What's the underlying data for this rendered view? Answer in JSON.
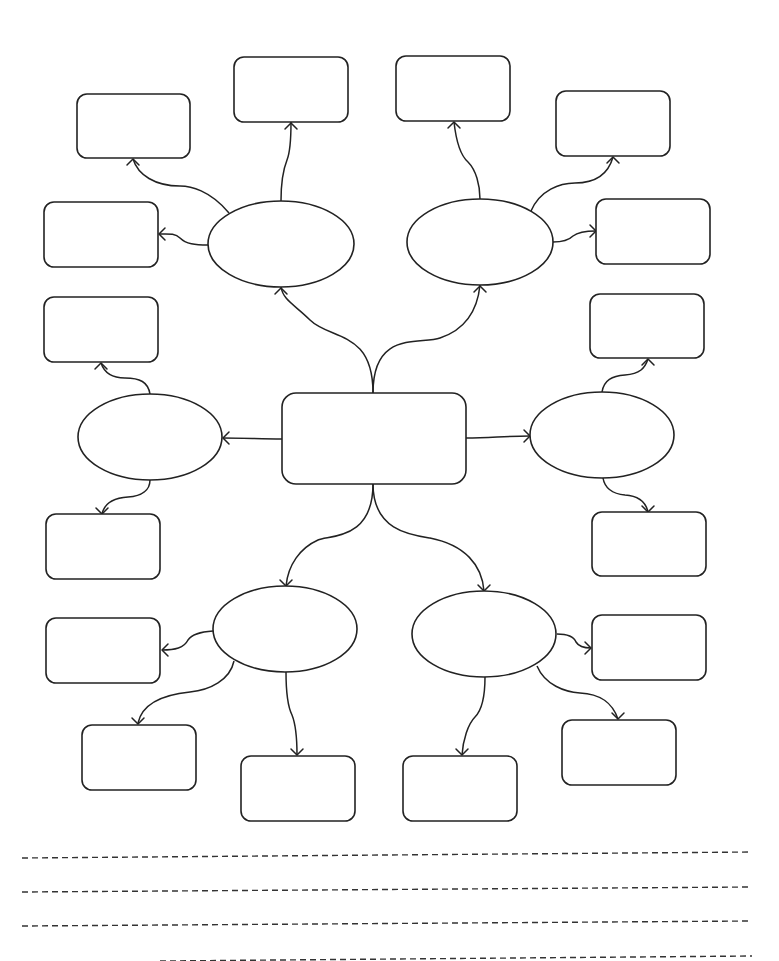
{
  "diagram": {
    "type": "mind-map-worksheet",
    "colors": {
      "stroke": "#222222",
      "background": "#ffffff",
      "lines": "#333333"
    },
    "center": {
      "id": "center",
      "x": 282,
      "y": 393,
      "w": 184,
      "h": 91,
      "rx": 14,
      "label": ""
    },
    "ovals": [
      {
        "id": "oval-top-left",
        "cx": 281,
        "cy": 244,
        "rx": 73,
        "ry": 43,
        "label": ""
      },
      {
        "id": "oval-top-right",
        "cx": 480,
        "cy": 242,
        "rx": 73,
        "ry": 43,
        "label": ""
      },
      {
        "id": "oval-mid-left",
        "cx": 150,
        "cy": 437,
        "rx": 72,
        "ry": 43,
        "label": ""
      },
      {
        "id": "oval-mid-right",
        "cx": 602,
        "cy": 435,
        "rx": 72,
        "ry": 43,
        "label": ""
      },
      {
        "id": "oval-bottom-left",
        "cx": 285,
        "cy": 629,
        "rx": 72,
        "ry": 43,
        "label": ""
      },
      {
        "id": "oval-bottom-right",
        "cx": 484,
        "cy": 634,
        "rx": 72,
        "ry": 43,
        "label": ""
      }
    ],
    "boxes": [
      {
        "id": "box-1",
        "x": 77,
        "y": 94,
        "w": 113,
        "h": 64,
        "label": ""
      },
      {
        "id": "box-2",
        "x": 234,
        "y": 57,
        "w": 114,
        "h": 65,
        "label": ""
      },
      {
        "id": "box-3",
        "x": 44,
        "y": 202,
        "w": 114,
        "h": 65,
        "label": ""
      },
      {
        "id": "box-4",
        "x": 396,
        "y": 56,
        "w": 114,
        "h": 65,
        "label": ""
      },
      {
        "id": "box-5",
        "x": 556,
        "y": 91,
        "w": 114,
        "h": 65,
        "label": ""
      },
      {
        "id": "box-6",
        "x": 596,
        "y": 199,
        "w": 114,
        "h": 65,
        "label": ""
      },
      {
        "id": "box-7",
        "x": 44,
        "y": 297,
        "w": 114,
        "h": 65,
        "label": ""
      },
      {
        "id": "box-8",
        "x": 46,
        "y": 514,
        "w": 114,
        "h": 65,
        "label": ""
      },
      {
        "id": "box-9",
        "x": 590,
        "y": 294,
        "w": 114,
        "h": 64,
        "label": ""
      },
      {
        "id": "box-10",
        "x": 592,
        "y": 512,
        "w": 114,
        "h": 64,
        "label": ""
      },
      {
        "id": "box-11",
        "x": 46,
        "y": 618,
        "w": 114,
        "h": 65,
        "label": ""
      },
      {
        "id": "box-12",
        "x": 82,
        "y": 725,
        "w": 114,
        "h": 65,
        "label": ""
      },
      {
        "id": "box-13",
        "x": 241,
        "y": 756,
        "w": 114,
        "h": 65,
        "label": ""
      },
      {
        "id": "box-14",
        "x": 592,
        "y": 615,
        "w": 114,
        "h": 65,
        "label": ""
      },
      {
        "id": "box-15",
        "x": 562,
        "y": 720,
        "w": 114,
        "h": 65,
        "label": ""
      },
      {
        "id": "box-16",
        "x": 403,
        "y": 756,
        "w": 114,
        "h": 65,
        "label": ""
      }
    ],
    "connectors": [
      {
        "id": "c-center-ovtl",
        "d": "M373,393 C373,330 330,340 310,320 C295,305 283,300 281,287",
        "tip": [
          281,
          288
        ],
        "dir": "up"
      },
      {
        "id": "c-center-ovtr",
        "d": "M373,393 C373,330 420,345 440,338 C470,328 478,305 480,285",
        "tip": [
          480,
          286
        ],
        "dir": "up"
      },
      {
        "id": "c-center-ovml",
        "d": "M282,439 C260,439 245,438 223,438",
        "tip": [
          223,
          438
        ],
        "dir": "left"
      },
      {
        "id": "c-center-ovmr",
        "d": "M466,438 C490,438 505,436 530,436",
        "tip": [
          530,
          436
        ],
        "dir": "right"
      },
      {
        "id": "c-center-ovbl",
        "d": "M373,484 C373,540 330,535 318,540 C300,548 288,565 286,586",
        "tip": [
          286,
          586
        ],
        "dir": "down"
      },
      {
        "id": "c-center-ovbr",
        "d": "M373,484 C373,530 410,535 430,538 C465,545 482,565 484,591",
        "tip": [
          484,
          591
        ],
        "dir": "down"
      },
      {
        "id": "c-ovtl-b1",
        "d": "M229,213 C210,190 190,186 180,186 C155,186 138,175 133,159",
        "tip": [
          133,
          159
        ],
        "dir": "up"
      },
      {
        "id": "c-ovtl-b2",
        "d": "M281,201 C281,185 283,170 287,160 C291,150 291,135 291,122",
        "tip": [
          291,
          123
        ],
        "dir": "up"
      },
      {
        "id": "c-ovtl-b3",
        "d": "M208,245 C195,245 186,244 180,238 C175,233 168,234 159,234",
        "tip": [
          159,
          234
        ],
        "dir": "left"
      },
      {
        "id": "c-ovtr-b4",
        "d": "M480,199 C480,185 476,170 468,162 C460,155 456,140 454,122",
        "tip": [
          454,
          122
        ],
        "dir": "up"
      },
      {
        "id": "c-ovtr-b5",
        "d": "M531,211 C540,190 560,183 575,183 C595,183 608,175 613,157",
        "tip": [
          613,
          157
        ],
        "dir": "up"
      },
      {
        "id": "c-ovtr-b6",
        "d": "M553,242 C562,242 568,241 573,236 C578,232 586,231 596,231",
        "tip": [
          596,
          231
        ],
        "dir": "right"
      },
      {
        "id": "c-ovml-b7",
        "d": "M150,394 C148,382 140,378 125,378 C112,378 104,372 101,363",
        "tip": [
          101,
          363
        ],
        "dir": "up"
      },
      {
        "id": "c-ovml-b8",
        "d": "M150,480 C150,490 142,496 128,497 C112,498 104,505 102,514",
        "tip": [
          102,
          514
        ],
        "dir": "down"
      },
      {
        "id": "c-ovmr-b9",
        "d": "M602,392 C604,380 612,376 625,375 C640,374 645,368 648,359",
        "tip": [
          648,
          359
        ],
        "dir": "up"
      },
      {
        "id": "c-ovmr-b10",
        "d": "M603,478 C605,490 615,494 625,495 C640,496 646,503 648,512",
        "tip": [
          648,
          512
        ],
        "dir": "down"
      },
      {
        "id": "c-ovbl-b11",
        "d": "M213,631 C200,632 192,634 188,640 C184,648 175,650 162,650",
        "tip": [
          162,
          650
        ],
        "dir": "left"
      },
      {
        "id": "c-ovbl-b12",
        "d": "M234,661 C230,680 210,690 190,692 C160,695 142,705 138,723",
        "tip": [
          138,
          724
        ],
        "dir": "down"
      },
      {
        "id": "c-ovbl-b13",
        "d": "M286,672 C286,690 287,705 292,715 C296,725 297,740 297,755",
        "tip": [
          297,
          755
        ],
        "dir": "down"
      },
      {
        "id": "c-ovbr-b14",
        "d": "M557,634 C568,634 574,637 576,642 C579,647 584,648 591,648",
        "tip": [
          591,
          648
        ],
        "dir": "right"
      },
      {
        "id": "c-ovbr-b15",
        "d": "M537,666 C545,685 565,692 580,693 C600,694 612,702 618,719",
        "tip": [
          618,
          719
        ],
        "dir": "down"
      },
      {
        "id": "c-ovbr-b16",
        "d": "M485,677 C485,695 482,710 475,717 C468,724 463,740 462,755",
        "tip": [
          462,
          755
        ],
        "dir": "down"
      }
    ],
    "writing_lines": [
      {
        "id": "line-1",
        "x1": 22,
        "y1": 858,
        "x2": 752,
        "y2": 852
      },
      {
        "id": "line-2",
        "x1": 22,
        "y1": 892,
        "x2": 752,
        "y2": 887
      },
      {
        "id": "line-3",
        "x1": 22,
        "y1": 926,
        "x2": 752,
        "y2": 921
      },
      {
        "id": "line-4",
        "x1": 160,
        "y1": 961,
        "x2": 752,
        "y2": 956
      }
    ]
  }
}
